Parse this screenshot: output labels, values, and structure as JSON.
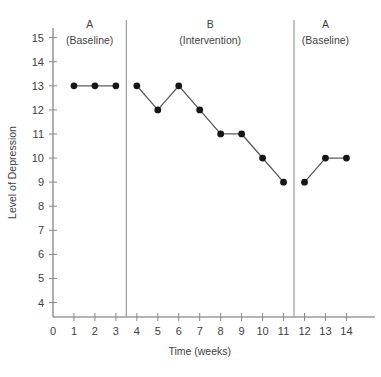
{
  "chart_data": {
    "type": "line",
    "title": "",
    "xlabel": "Time (weeks)",
    "ylabel": "Level of Depression",
    "xlim": [
      0,
      14.6
    ],
    "ylim": [
      3.4,
      15.4
    ],
    "grid": false,
    "legend": "none",
    "x_ticks": [
      0,
      1,
      2,
      3,
      4,
      5,
      6,
      7,
      8,
      9,
      10,
      11,
      12,
      13,
      14
    ],
    "x_tick_labels": [
      "0",
      "1",
      "2",
      "3",
      "4",
      "5",
      "6",
      "7",
      "8",
      "9",
      "10",
      "11",
      "12",
      "13",
      "14"
    ],
    "y_ticks": [
      4,
      5,
      6,
      7,
      8,
      9,
      10,
      11,
      12,
      13,
      14,
      15
    ],
    "y_tick_labels": [
      "4",
      "5",
      "6",
      "7",
      "8",
      "9",
      "10",
      "11",
      "12",
      "13",
      "14",
      "15"
    ],
    "marker_color": "#161616",
    "line_color": "#5c5c5c",
    "phases": [
      {
        "id": "phase-a1",
        "label": "A",
        "sublabel": "(Baseline)",
        "x_start": 0.0,
        "x_end": 3.5,
        "label_x": 1.75,
        "x": [
          1,
          2,
          3
        ],
        "y": [
          13,
          13,
          13
        ]
      },
      {
        "id": "phase-b",
        "label": "B",
        "sublabel": "(Intervention)",
        "x_start": 3.5,
        "x_end": 11.5,
        "label_x": 7.5,
        "x": [
          4,
          5,
          6,
          7,
          8,
          9,
          10,
          11
        ],
        "y": [
          13,
          12,
          13,
          12,
          11,
          11,
          10,
          9
        ]
      },
      {
        "id": "phase-a2",
        "label": "A",
        "sublabel": "(Baseline)",
        "x_start": 11.5,
        "x_end": 14.6,
        "label_x": 13.0,
        "x": [
          12,
          13,
          14
        ],
        "y": [
          9,
          10,
          10
        ]
      }
    ],
    "dividers": [
      3.5,
      11.5
    ]
  }
}
